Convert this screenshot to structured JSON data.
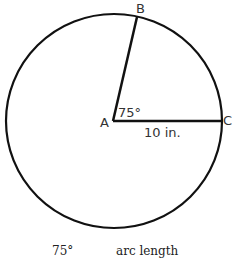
{
  "diagram": {
    "type": "circle-sector",
    "points": {
      "A": {
        "label": "A"
      },
      "B": {
        "label": "B"
      },
      "C": {
        "label": "C"
      }
    },
    "angle_label": "75°",
    "radius_label": "10 in.",
    "stroke_color": "#111111"
  },
  "formula": {
    "left_numerator": "75°",
    "right_numerator": "arc length"
  }
}
